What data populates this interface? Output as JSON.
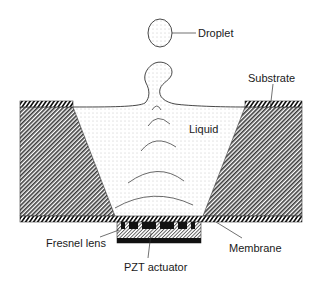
{
  "diagram": {
    "type": "cross-section schematic",
    "colors": {
      "background": "#ffffff",
      "outline": "#222222",
      "hatch": "#333333",
      "liquid_dots": "#8a8a8a",
      "electrode": "#111111"
    },
    "labels": {
      "droplet": "Droplet",
      "substrate": "Substrate",
      "liquid": "Liquid",
      "fresnel_lens": "Fresnel lens",
      "membrane": "Membrane",
      "pzt_actuator": "PZT actuator"
    },
    "components": [
      {
        "id": "droplet",
        "label": "Droplet",
        "shape": "ellipse"
      },
      {
        "id": "substrate",
        "label": "Substrate",
        "shape": "trapezoid-blocks"
      },
      {
        "id": "liquid",
        "label": "Liquid",
        "shape": "inverted-trapezoid"
      },
      {
        "id": "fresnel_lens",
        "label": "Fresnel lens",
        "shape": "segmented-electrodes"
      },
      {
        "id": "membrane",
        "label": "Membrane",
        "shape": "thin-layer"
      },
      {
        "id": "pzt_actuator",
        "label": "PZT actuator",
        "shape": "rectangle"
      }
    ],
    "wavefronts": 5
  }
}
